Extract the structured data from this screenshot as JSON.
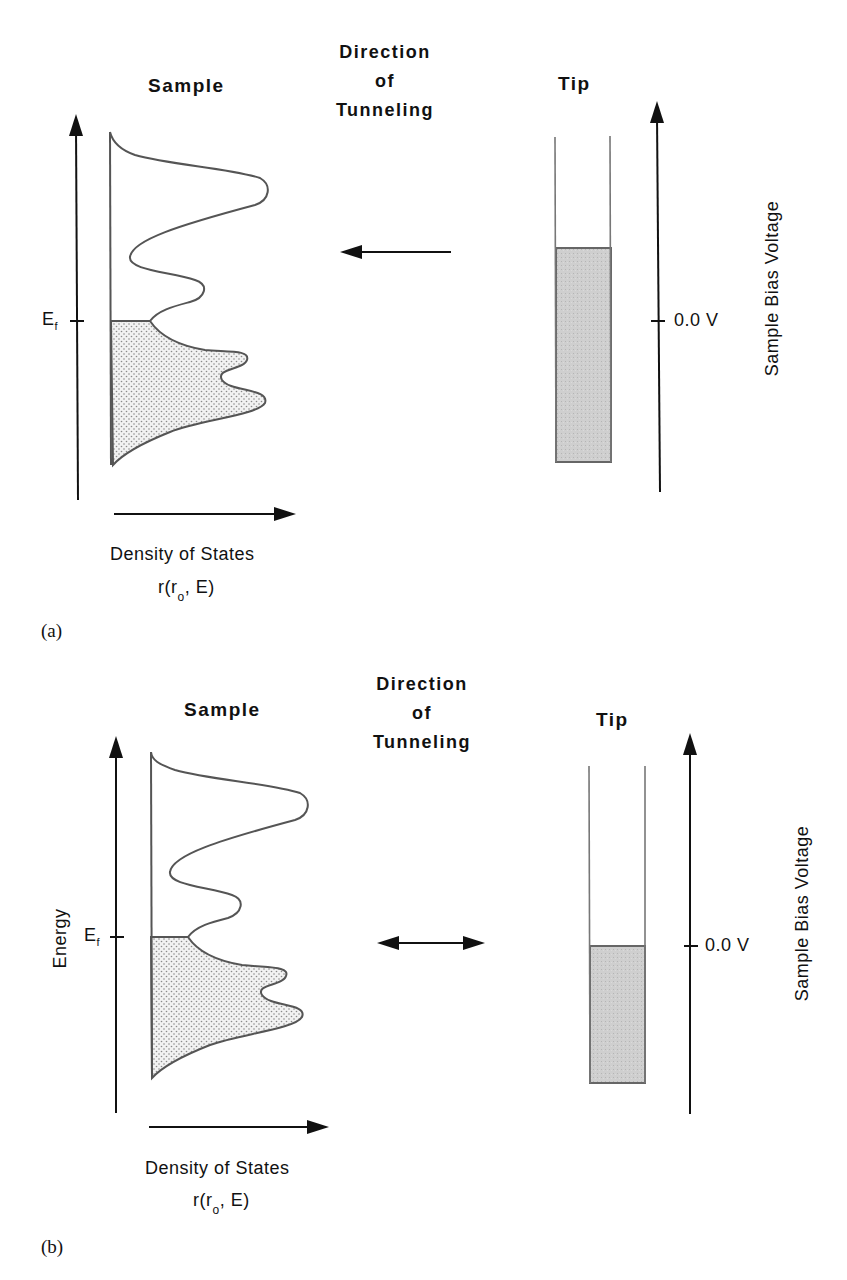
{
  "figure": {
    "panels": [
      {
        "tag": "(a)",
        "sample_title": "Sample",
        "tip_title": "Tip",
        "direction_lines": [
          "Direction",
          "of",
          "Tunneling"
        ],
        "direction_arrow": "left (tip to sample)",
        "energy_axis_label": "",
        "fermi_label_main": "E",
        "fermi_label_sub": "f",
        "bias_tick_label": "0.0 V",
        "bias_axis_label": "Sample Bias Voltage",
        "dos_label": "Density of States",
        "dos_func_prefix": "r(r",
        "dos_func_sub": "o",
        "dos_func_suffix": ", E)"
      },
      {
        "tag": "(b)",
        "sample_title": "Sample",
        "tip_title": "Tip",
        "direction_lines": [
          "Direction",
          "of",
          "Tunneling"
        ],
        "direction_arrow": "bidirectional (equilibrium)",
        "energy_axis_label": "Energy",
        "fermi_label_main": "E",
        "fermi_label_sub": "f",
        "bias_tick_label": "0.0 V",
        "bias_axis_label": "Sample Bias Voltage",
        "dos_label": "Density of States",
        "dos_func_prefix": "r(r",
        "dos_func_sub": "o",
        "dos_func_suffix": ", E)"
      }
    ],
    "colors": {
      "line": "#111111",
      "curve": "#555555",
      "dotted_fill": "#e6e6e6",
      "tip_fill": "#c9c9c9"
    }
  }
}
